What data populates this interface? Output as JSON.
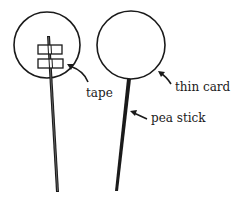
{
  "diagram": {
    "labels": {
      "tape": "tape",
      "thin_card": "thin card",
      "pea_stick": "pea stick"
    },
    "colors": {
      "ink": "#1a1a1a",
      "background": "#ffffff"
    }
  }
}
